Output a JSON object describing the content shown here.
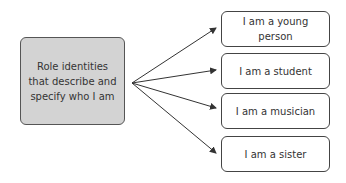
{
  "diagram": {
    "source": {
      "label": "Role identities that describe and specify who I am"
    },
    "targets": [
      {
        "label": "I am a young person"
      },
      {
        "label": "I am a student"
      },
      {
        "label": "I am a musician"
      },
      {
        "label": "I am a sister"
      }
    ],
    "colors": {
      "source_fill": "#d3d3d3",
      "stroke": "#444444"
    }
  }
}
